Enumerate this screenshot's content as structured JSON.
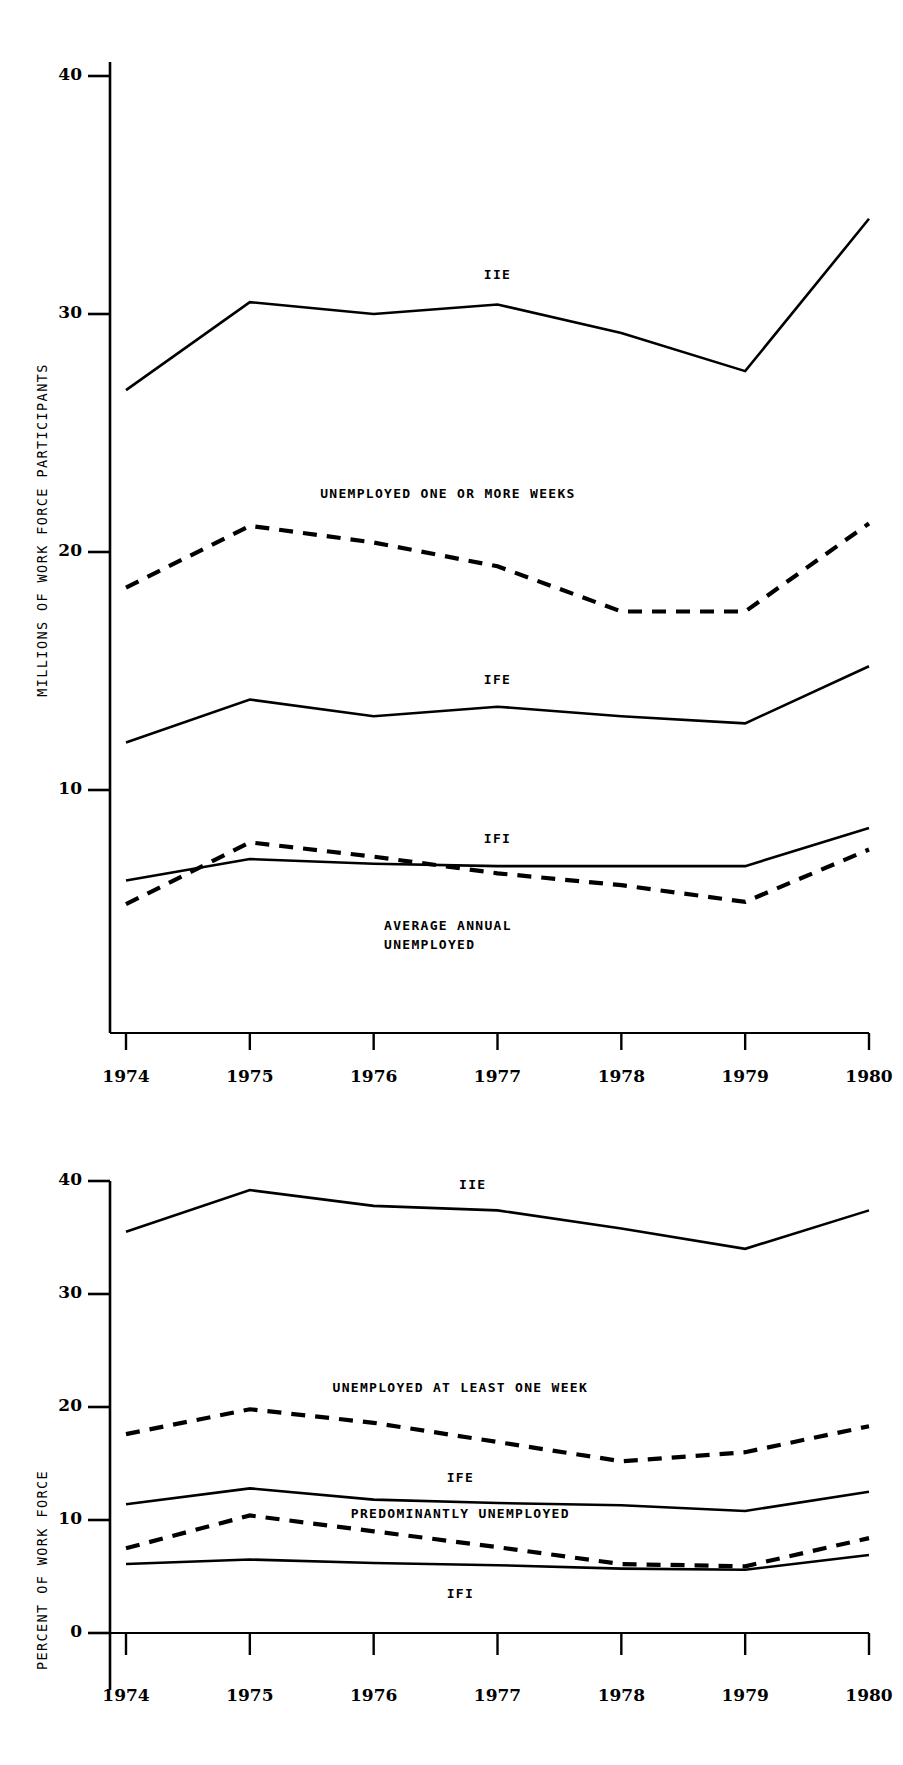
{
  "page": {
    "figure_count": 2,
    "background": "#ffffff",
    "ink": "#000000"
  },
  "chart_data": [
    {
      "id": "figure-top",
      "type": "line",
      "title": "",
      "xlabel": "",
      "ylabel": "MILLIONS OF WORK FORCE PARTICIPANTS",
      "x": [
        "1974",
        "1975",
        "1976",
        "1977",
        "1978",
        "1979",
        "1980"
      ],
      "xlim": [
        1974,
        1980
      ],
      "ylim": [
        0,
        40
      ],
      "yticks": [
        10,
        20,
        30,
        40
      ],
      "ytick_labels": [
        "10",
        "20",
        "30",
        "40"
      ],
      "grid": false,
      "legend_position": "inline-annotations",
      "series": [
        {
          "name": "IIE",
          "label": "IIE",
          "style": "solid",
          "values": [
            26.8,
            30.5,
            30.0,
            30.4,
            29.2,
            27.6,
            34.0
          ],
          "label_x": "1977",
          "label_y": 31.6
        },
        {
          "name": "UNEMPLOYED ONE OR MORE WEEKS",
          "label": "UNEMPLOYED ONE OR MORE WEEKS",
          "style": "dashed",
          "values": [
            18.5,
            21.1,
            20.4,
            19.4,
            17.5,
            17.5,
            21.2
          ],
          "label_x": "1976.6",
          "label_y": 22.4
        },
        {
          "name": "IFE",
          "label": "IFE",
          "style": "solid",
          "values": [
            12.0,
            13.8,
            13.1,
            13.5,
            13.1,
            12.8,
            15.2
          ],
          "label_x": "1977",
          "label_y": 14.6
        },
        {
          "name": "IFI",
          "label": "IFI",
          "style": "solid",
          "values": [
            6.2,
            7.1,
            6.9,
            6.8,
            6.8,
            6.8,
            8.4
          ],
          "label_x": "1977",
          "label_y": 7.9
        },
        {
          "name": "AVERAGE ANNUAL UNEMPLOYED",
          "label": "AVERAGE ANNUAL\nUNEMPLOYED",
          "label_line1": "AVERAGE ANNUAL",
          "label_line2": "UNEMPLOYED",
          "style": "dashed",
          "values": [
            5.2,
            7.8,
            7.2,
            6.5,
            6.0,
            5.3,
            7.5
          ],
          "label_x": "1976.6",
          "label_y": 4.3
        }
      ]
    },
    {
      "id": "figure-bottom",
      "type": "line",
      "title": "",
      "xlabel": "",
      "ylabel": "PERCENT OF WORK FORCE",
      "x": [
        "1974",
        "1975",
        "1976",
        "1977",
        "1978",
        "1979",
        "1980"
      ],
      "xlim": [
        1974,
        1980
      ],
      "ylim": [
        0,
        40
      ],
      "yticks": [
        0,
        10,
        20,
        30,
        40
      ],
      "ytick_labels": [
        "0",
        "10",
        "20",
        "30",
        "40"
      ],
      "grid": false,
      "legend_position": "inline-annotations",
      "series": [
        {
          "name": "IIE",
          "label": "IIE",
          "style": "solid",
          "values": [
            35.5,
            39.2,
            37.8,
            37.4,
            35.8,
            34.0,
            37.4
          ],
          "label_x": "1976.8",
          "label_y": 39.6
        },
        {
          "name": "UNEMPLOYED AT LEAST ONE WEEK",
          "label": "UNEMPLOYED AT LEAST ONE WEEK",
          "style": "dashed",
          "values": [
            17.6,
            19.8,
            18.6,
            16.9,
            15.2,
            16.0,
            18.3
          ],
          "label_x": "1976.7",
          "label_y": 21.6
        },
        {
          "name": "IFE",
          "label": "IFE",
          "style": "solid",
          "values": [
            11.4,
            12.8,
            11.8,
            11.5,
            11.3,
            10.8,
            12.5
          ],
          "label_x": "1976.7",
          "label_y": 13.6
        },
        {
          "name": "PREDOMINANTLY UNEMPLOYED",
          "label": "PREDOMINANTLY UNEMPLOYED",
          "style": "dashed",
          "values": [
            7.5,
            10.4,
            9.0,
            7.6,
            6.1,
            5.9,
            8.4
          ],
          "label_x": "1976.7",
          "label_y": 10.4
        },
        {
          "name": "IFI",
          "label": "IFI",
          "style": "solid",
          "values": [
            6.1,
            6.5,
            6.2,
            6.0,
            5.7,
            5.6,
            6.9
          ],
          "label_x": "1976.7",
          "label_y": 3.4
        }
      ]
    }
  ]
}
